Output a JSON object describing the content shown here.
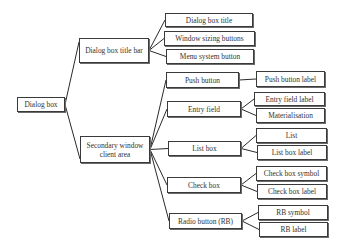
{
  "diagram": {
    "line_color": "#2a2a2a",
    "root": {
      "id": "dialog_box",
      "label": "Dialog box",
      "box": [
        17,
        97,
        48,
        15
      ]
    },
    "level1": [
      {
        "id": "title_bar",
        "label": "Dialog box title bar",
        "box": [
          79,
          38,
          70,
          25
        ]
      },
      {
        "id": "client_area",
        "label": "Secondary window client area",
        "box": [
          80,
          136,
          70,
          27
        ]
      }
    ],
    "level2": [
      {
        "id": "dialog_box_title",
        "parent": "title_bar",
        "label": "Dialog box title",
        "box": [
          165,
          13,
          88,
          14
        ]
      },
      {
        "id": "window_sizing_buttons",
        "parent": "title_bar",
        "label": "Window sizing buttons",
        "box": [
          164,
          31,
          91,
          15
        ]
      },
      {
        "id": "menu_system_button",
        "parent": "title_bar",
        "label": "Menu system button",
        "box": [
          166,
          49,
          88,
          15
        ]
      },
      {
        "id": "push_button",
        "parent": "client_area",
        "label": "Push button",
        "box": [
          166,
          72,
          73,
          16
        ]
      },
      {
        "id": "entry_field",
        "parent": "client_area",
        "label": "Entry field",
        "box": [
          167,
          101,
          74,
          16
        ]
      },
      {
        "id": "list_box",
        "parent": "client_area",
        "label": "List box",
        "box": [
          168,
          141,
          73,
          15
        ]
      },
      {
        "id": "check_box",
        "parent": "client_area",
        "label": "Check box",
        "box": [
          167,
          177,
          74,
          16
        ]
      },
      {
        "id": "radio_button",
        "parent": "client_area",
        "label": "Radio button (RB)",
        "box": [
          169,
          213,
          73,
          16
        ]
      }
    ],
    "level3": [
      {
        "id": "push_button_label",
        "parent": "push_button",
        "label": "Push button label",
        "box": [
          256,
          71,
          69,
          16
        ]
      },
      {
        "id": "entry_field_label",
        "parent": "entry_field",
        "label": "Entry field label",
        "box": [
          254,
          92,
          71,
          14
        ]
      },
      {
        "id": "materialisation",
        "parent": "entry_field",
        "label": "Materialisation",
        "box": [
          256,
          108,
          69,
          15
        ]
      },
      {
        "id": "list",
        "parent": "list_box",
        "label": "List",
        "box": [
          256,
          128,
          71,
          15
        ]
      },
      {
        "id": "list_box_label",
        "parent": "list_box",
        "label": "List box label",
        "box": [
          257,
          145,
          70,
          15
        ]
      },
      {
        "id": "check_box_symbol",
        "parent": "check_box",
        "label": "Check box symbol",
        "box": [
          256,
          166,
          71,
          15
        ]
      },
      {
        "id": "check_box_label",
        "parent": "check_box",
        "label": "Check box label",
        "box": [
          257,
          184,
          70,
          15
        ]
      },
      {
        "id": "rb_symbol",
        "parent": "radio_button",
        "label": "RB symbol",
        "box": [
          258,
          205,
          70,
          15
        ]
      },
      {
        "id": "rb_label",
        "parent": "radio_button",
        "label": "RB label",
        "box": [
          259,
          222,
          69,
          15
        ]
      }
    ]
  }
}
